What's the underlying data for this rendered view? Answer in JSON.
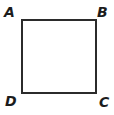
{
  "figure": {
    "name": "square-abcd",
    "background_color": "#ffffff",
    "stroke_color": "#2b2b2b",
    "stroke_width": 1.6,
    "square": {
      "left": 22,
      "top": 20,
      "right": 96,
      "bottom": 93,
      "width": 74,
      "height": 73
    },
    "vertices": [
      {
        "id": "vertex-a",
        "label": "A",
        "position": "top-left"
      },
      {
        "id": "vertex-b",
        "label": "B",
        "position": "top-right"
      },
      {
        "id": "vertex-c",
        "label": "C",
        "position": "bottom-right"
      },
      {
        "id": "vertex-d",
        "label": "D",
        "position": "bottom-left"
      }
    ]
  }
}
